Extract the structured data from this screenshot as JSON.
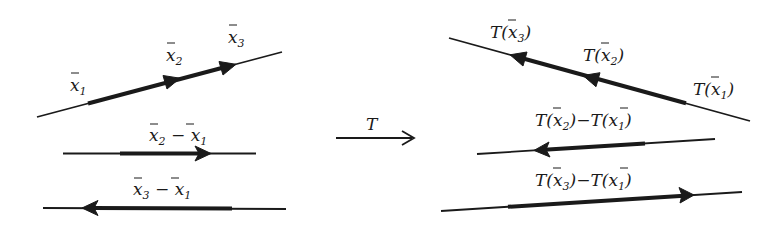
{
  "left_panel": {
    "labels": {
      "x1": {
        "base": "x",
        "sub": "1"
      },
      "x2": {
        "base": "x",
        "sub": "2"
      },
      "x3": {
        "base": "x",
        "sub": "3"
      },
      "diff21": {
        "a": "x",
        "a_sub": "2",
        "op": " − ",
        "b": "x",
        "b_sub": "1"
      },
      "diff31": {
        "a": "x",
        "a_sub": "3",
        "op": " − ",
        "b": "x",
        "b_sub": "1"
      }
    }
  },
  "transform": {
    "label": "T"
  },
  "right_panel": {
    "labels": {
      "tx1": {
        "pre": "T(",
        "base": "x",
        "sub": "1",
        "post": ")"
      },
      "tx2": {
        "pre": "T(",
        "base": "x",
        "sub": "2",
        "post": ")"
      },
      "tx3": {
        "pre": "T(",
        "base": "x",
        "sub": "3",
        "post": ")"
      },
      "diff21": {
        "pre1": "T(",
        "a": "x",
        "a_sub": "2",
        "mid": ")−T(",
        "b": "x",
        "b_sub": "1",
        "post": ")"
      },
      "diff31": {
        "pre1": "T(",
        "a": "x",
        "a_sub": "3",
        "mid": ")−T(",
        "b": "x",
        "b_sub": "1",
        "post": ")"
      }
    }
  },
  "colors": {
    "ink": "#1a1a1a",
    "background": "#ffffff"
  }
}
